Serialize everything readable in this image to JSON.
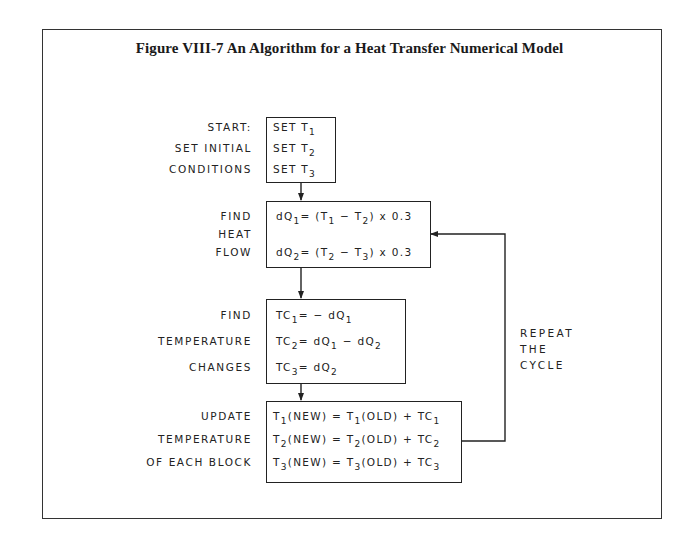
{
  "figure": {
    "title": "Figure VIII-7  An Algorithm for a Heat Transfer Numerical Model"
  },
  "steps": [
    {
      "labels": [
        "START:",
        "SET INITIAL",
        "CONDITIONS"
      ],
      "lines": [
        {
          "pre": "SET T",
          "sub": "1",
          "post": ""
        },
        {
          "pre": "SET T",
          "sub": "2",
          "post": ""
        },
        {
          "pre": "SET T",
          "sub": "3",
          "post": ""
        }
      ]
    },
    {
      "labels": [
        "FIND",
        "HEAT",
        "FLOW"
      ],
      "lines": [
        {
          "text": "dQ1 = (T1 − T2) x 0.3",
          "a": "dQ",
          "a_sub": "1",
          "b": "= (T",
          "b_sub": "1",
          "c": " − T",
          "c_sub": "2",
          "d": ")  x 0.3"
        },
        {
          "text": "dQ2 = (T2 − T3) x 0.3",
          "a": "dQ",
          "a_sub": "2",
          "b": "= (T",
          "b_sub": "2",
          "c": " − T",
          "c_sub": "3",
          "d": ")  x 0.3"
        }
      ]
    },
    {
      "labels": [
        "FIND",
        "TEMPERATURE",
        "CHANGES"
      ],
      "lines": [
        {
          "text": "TC1 = −dQ1",
          "a": "TC",
          "a_sub": "1",
          "b": "= − dQ",
          "b_sub": "1",
          "c": "",
          "c_sub": ""
        },
        {
          "text": "TC2 = dQ1 − dQ2",
          "a": "TC",
          "a_sub": "2",
          "b": "=   dQ",
          "b_sub": "1",
          "c": " − dQ",
          "c_sub": "2"
        },
        {
          "text": "TC3 = dQ2",
          "a": "TC",
          "a_sub": "3",
          "b": "=   dQ",
          "b_sub": "2",
          "c": "",
          "c_sub": ""
        }
      ]
    },
    {
      "labels": [
        "UPDATE",
        "TEMPERATURE",
        "OF EACH BLOCK"
      ],
      "lines": [
        {
          "text": "T1(NEW) = T1(OLD) + TC1",
          "a": "T",
          "a_sub": "1",
          "b": "(NEW) = T",
          "b_sub": "1",
          "c": "(OLD) + TC",
          "c_sub": "1"
        },
        {
          "text": "T2(NEW) = T2(OLD) + TC2",
          "a": "T",
          "a_sub": "2",
          "b": "(NEW) = T",
          "b_sub": "2",
          "c": "(OLD) + TC",
          "c_sub": "2"
        },
        {
          "text": "T3(NEW) = T3(OLD) + TC3",
          "a": "T",
          "a_sub": "3",
          "b": "(NEW) = T",
          "b_sub": "3",
          "c": "(OLD) + TC",
          "c_sub": "3"
        }
      ]
    }
  ],
  "loop_note": [
    "REPEAT",
    "THE",
    "CYCLE"
  ]
}
